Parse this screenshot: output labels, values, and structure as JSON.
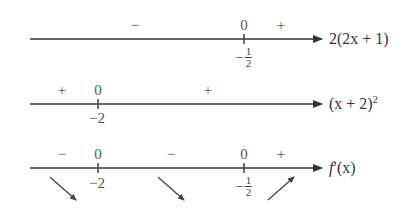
{
  "rows": [
    {
      "expression": "2(2x + 1)",
      "signs": [
        {
          "text": "−",
          "x": 135
        },
        {
          "text": "+",
          "x": 281
        }
      ],
      "zeros": [
        {
          "text": "0",
          "x": 244
        }
      ],
      "ticks": [
        {
          "label_neg": "−",
          "label_num": "1",
          "label_den": "2",
          "x": 244
        }
      ]
    },
    {
      "expression": "(x + 2)",
      "exponent": "2",
      "signs": [
        {
          "text": "+",
          "x": 62
        },
        {
          "text": "+",
          "x": 208
        }
      ],
      "zeros": [
        {
          "text": "0",
          "x": 98
        }
      ],
      "ticks": [
        {
          "label": "−2",
          "x": 98
        }
      ]
    },
    {
      "expression_f": "f",
      "expression_prime": "′",
      "expression_arg": "(x)",
      "signs": [
        {
          "text": "−",
          "x": 62
        },
        {
          "text": "−",
          "x": 171
        },
        {
          "text": "+",
          "x": 281
        }
      ],
      "zeros": [
        {
          "text": "0",
          "x": 98
        },
        {
          "text": "0",
          "x": 244
        }
      ],
      "ticks": [
        {
          "label": "−2",
          "x": 98
        },
        {
          "label_neg": "−",
          "label_num": "1",
          "label_den": "2",
          "x": 244
        }
      ],
      "variation_arrows": [
        "decreasing",
        "decreasing",
        "increasing"
      ]
    }
  ]
}
